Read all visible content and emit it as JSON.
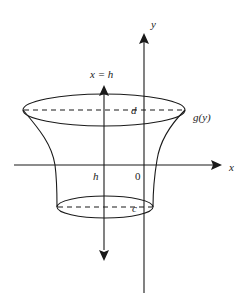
{
  "diagram": {
    "type": "solid-of-revolution",
    "labels": {
      "y_axis": "y",
      "x_axis": "x",
      "axis_of_rotation": "x = h",
      "h_tick": "h",
      "origin": "0",
      "top_level": "d",
      "bottom_level": "c",
      "curve": "g(y)"
    },
    "colors": {
      "stroke": "#1a1a1a",
      "background": "#ffffff"
    }
  }
}
